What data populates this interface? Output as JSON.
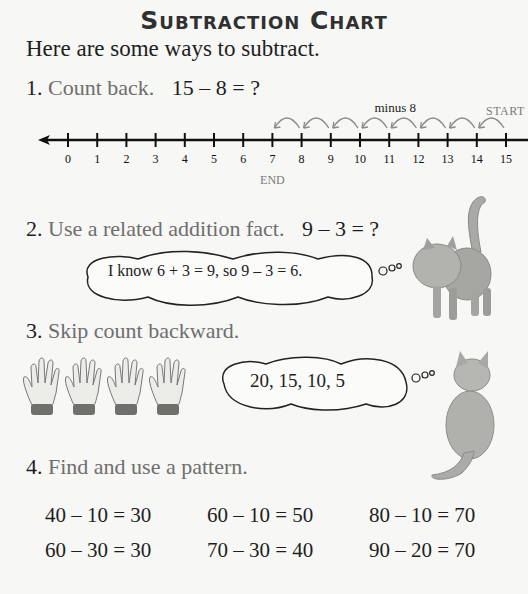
{
  "title": "Subtraction Chart",
  "intro": "Here are some ways to subtract.",
  "steps": [
    {
      "num": "1.",
      "text": "Count back.",
      "equation": "15 – 8 = ?"
    },
    {
      "num": "2.",
      "text": "Use a related addition fact.",
      "equation": "9 – 3 = ?"
    },
    {
      "num": "3.",
      "text": "Skip count backward.",
      "equation": ""
    },
    {
      "num": "4.",
      "text": "Find and use a pattern.",
      "equation": ""
    }
  ],
  "number_line": {
    "min": 0,
    "max": 15,
    "ticks": [
      "0",
      "1",
      "2",
      "3",
      "4",
      "5",
      "6",
      "7",
      "8",
      "9",
      "10",
      "11",
      "12",
      "13",
      "14",
      "15"
    ],
    "start_value": 15,
    "end_value": 7,
    "hops": 8,
    "hop_label": "minus 8",
    "start_label": "START",
    "end_label": "END"
  },
  "thought_bubbles": {
    "addition_fact": "I know 6 + 3 = 9, so 9 – 3 = 6.",
    "skip_count": "20, 15, 10, 5"
  },
  "illustrations": {
    "gloves_count": 4,
    "cats": [
      "standing-cat",
      "sitting-cat"
    ]
  },
  "patterns": [
    [
      "40 – 10 = 30",
      "60 – 30 = 30"
    ],
    [
      "60 – 10 = 50",
      "70 – 30 = 40"
    ],
    [
      "80 – 10 = 70",
      "90 – 20 = 70"
    ]
  ]
}
